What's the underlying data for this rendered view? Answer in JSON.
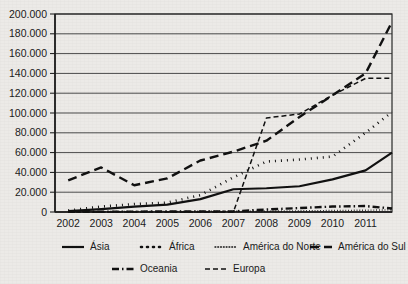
{
  "chart_data": {
    "type": "line",
    "title": "",
    "subtitle": "",
    "xlabel": "",
    "ylabel": "",
    "xlim": [
      2001.6,
      2011.8
    ],
    "ylim": [
      0,
      200000
    ],
    "grid": true,
    "legend_position": "bottom",
    "x": [
      2002,
      2003,
      2004,
      2005,
      2006,
      2007,
      2008,
      2009,
      2010,
      2011
    ],
    "categories": [
      "2002",
      "2003",
      "2004",
      "2005",
      "2006",
      "2007",
      "2008",
      "2009",
      "2010",
      "2011"
    ],
    "ytick_labels": [
      "0",
      "20.000",
      "40.000",
      "60.000",
      "80.000",
      "100.000",
      "120.000",
      "140.000",
      "160.000",
      "180.000",
      "200.000"
    ],
    "ytick_values": [
      0,
      20000,
      40000,
      60000,
      80000,
      100000,
      120000,
      140000,
      160000,
      180000,
      200000
    ],
    "series": [
      {
        "name": "Ásia",
        "style": "solid",
        "dash": "none",
        "width": 2.2,
        "values": [
          800,
          3000,
          5500,
          7500,
          13000,
          23000,
          24000,
          26000,
          33000,
          42000
        ],
        "end_value": 60000
      },
      {
        "name": "África",
        "style": "dotted-large",
        "dash": "1 5",
        "width": 2.6,
        "values": [
          1500,
          5500,
          8000,
          9500,
          17000,
          35000,
          51000,
          53000,
          56000,
          80000
        ],
        "end_value": 101000
      },
      {
        "name": "América do Norte",
        "style": "dotted-fine",
        "dash": "0.8 2",
        "width": 1.4,
        "values": [
          300,
          400,
          500,
          600,
          700,
          800,
          900,
          1200,
          1500,
          1800
        ],
        "end_value": 2200
      },
      {
        "name": "América do Sul",
        "style": "dashed-long",
        "dash": "9 5",
        "width": 2.4,
        "values": [
          32000,
          45000,
          27000,
          34000,
          52000,
          61000,
          72000,
          96000,
          118000,
          140000
        ],
        "end_value": 192000
      },
      {
        "name": "Oceania",
        "style": "dash-dot",
        "dash": "7 3 1.5 3",
        "width": 2.4,
        "values": [
          200,
          300,
          400,
          500,
          600,
          700,
          2500,
          4000,
          5500,
          6000
        ],
        "end_value": 3500
      },
      {
        "name": "Europa",
        "style": "dashed-short",
        "dash": "5 3",
        "width": 1.5,
        "values": [
          0,
          0,
          0,
          0,
          0,
          0,
          95000,
          99000,
          118000,
          135000
        ],
        "end_value": 135000
      }
    ]
  },
  "legend": {
    "rows": [
      [
        {
          "label": "Ásia",
          "key": "asia"
        },
        {
          "label": "África",
          "key": "africa"
        },
        {
          "label": "América do Norte",
          "key": "america-do-norte"
        },
        {
          "label": "América do Sul",
          "key": "america-do-sul"
        }
      ],
      [
        {
          "label": "Oceania",
          "key": "oceania"
        },
        {
          "label": "Europa",
          "key": "europa"
        }
      ]
    ]
  },
  "colors": {
    "ink": "#111111",
    "grid": "#4a4a4a",
    "frame": "#2a2a2a",
    "background": "#eceae7"
  }
}
